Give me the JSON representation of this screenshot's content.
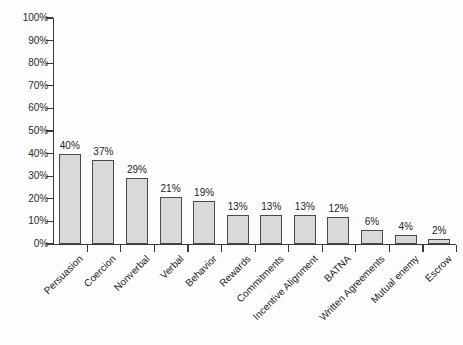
{
  "chart_data": {
    "type": "bar",
    "title": "",
    "xlabel": "",
    "ylabel": "",
    "categories": [
      "Persuasion",
      "Coercion",
      "Nonverbal",
      "Verbal",
      "Behavior",
      "Rewards",
      "Commitments",
      "Incentive Alignment",
      "BATNA",
      "Written Agreements",
      "Mutual enemy",
      "Escrow"
    ],
    "values": [
      40,
      37,
      29,
      21,
      19,
      13,
      13,
      13,
      12,
      6,
      4,
      2
    ],
    "value_labels": [
      "40%",
      "37%",
      "29%",
      "21%",
      "19%",
      "13%",
      "13%",
      "13%",
      "12%",
      "6%",
      "4%",
      "2%"
    ],
    "ylim": [
      0,
      100
    ],
    "ytick_values": [
      0,
      10,
      20,
      30,
      40,
      50,
      60,
      70,
      80,
      90,
      100
    ],
    "ytick_labels": [
      "0%",
      "10%",
      "20%",
      "30%",
      "40%",
      "50%",
      "60%",
      "70%",
      "80%",
      "90%",
      "100%"
    ],
    "grid": false,
    "legend": false,
    "legend_position": "none",
    "bar_fill_color": "#d9d9d9",
    "bar_edge_color": "#4a4a4a",
    "axis_color": "#3a3a3a",
    "background_color": "#fdfdfd",
    "xlabel_rotation_degrees": -45
  }
}
